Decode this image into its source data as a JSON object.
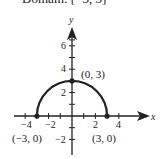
{
  "title": "Domain: [−3, 3]",
  "axes": {
    "x_label": "x",
    "y_label": "y"
  },
  "x_ticks": [
    "−4",
    "−2",
    "2",
    "4"
  ],
  "y_ticks": [
    "6",
    "4",
    "2",
    "−2"
  ],
  "points": [
    {
      "label": "(0, 3)",
      "x": 0,
      "y": 3
    },
    {
      "label": "(−3, 0)",
      "x": -3,
      "y": 0
    },
    {
      "label": "(3, 0)",
      "x": 3,
      "y": 0
    }
  ],
  "curve": "semicircle y = sqrt(9 − x²)",
  "colors": {
    "stroke": "#222222"
  }
}
